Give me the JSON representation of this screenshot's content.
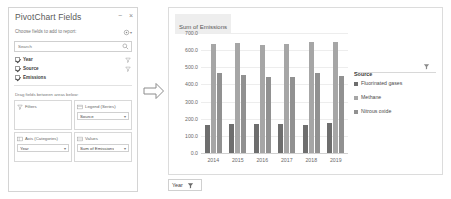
{
  "fields_panel": {
    "title": "PivotChart Fields",
    "pin_label": "−",
    "close_label": "×",
    "subtitle": "Choose fields to add to report:",
    "gear_icon": "gear-icon",
    "search": {
      "value": "",
      "placeholder": "Search",
      "icon": "search-icon"
    },
    "fields": [
      {
        "label": "Year",
        "checked": true,
        "filter_icon": "filter-icon"
      },
      {
        "label": "Source",
        "checked": true,
        "filter_icon": "filter-icon"
      },
      {
        "label": "Emissions",
        "checked": true,
        "filter_icon": ""
      }
    ],
    "drag_hint": "Drag fields between areas below:",
    "zones": [
      {
        "name": "Filters",
        "icon": "filter-icon",
        "chip": "",
        "has_chip": false
      },
      {
        "name": "Legend (Series)",
        "icon": "legend-icon",
        "chip": "Source",
        "has_chip": true
      },
      {
        "name": "Axis (Categories)",
        "icon": "axis-icon",
        "chip": "Year",
        "has_chip": true
      },
      {
        "name": "Values",
        "icon": "values-icon",
        "chip": "Sum of Emissions",
        "has_chip": true
      }
    ]
  },
  "arrow": {
    "icon": "right-arrow-icon"
  },
  "chart_panel": {
    "year_filter_button": {
      "label": "Year",
      "icon": "filter-icon"
    }
  },
  "chart_data": {
    "type": "bar",
    "title": "Sum of Emissions",
    "xlabel": "",
    "ylabel": "",
    "ylim": [
      0,
      700
    ],
    "ytick_step": 100,
    "ytick_labels": [
      "700.0",
      "600.0",
      "500.0",
      "400.0",
      "300.0",
      "200.0",
      "100.0",
      "0.0"
    ],
    "grid": true,
    "legend_position": "right",
    "legend_title": "Source",
    "categories": [
      "2014",
      "2015",
      "2016",
      "2017",
      "2018",
      "2019"
    ],
    "series": [
      {
        "name": "Fluorinated gases",
        "color": "#6e6e6e",
        "values": [
          172,
          175,
          176,
          174,
          172,
          182
        ]
      },
      {
        "name": "Methane",
        "color": "#a6a6a6",
        "values": [
          642,
          645,
          638,
          640,
          652,
          655
        ]
      },
      {
        "name": "Nitrous oxide",
        "color": "#919191",
        "values": [
          470,
          462,
          448,
          452,
          470,
          455
        ]
      }
    ]
  }
}
